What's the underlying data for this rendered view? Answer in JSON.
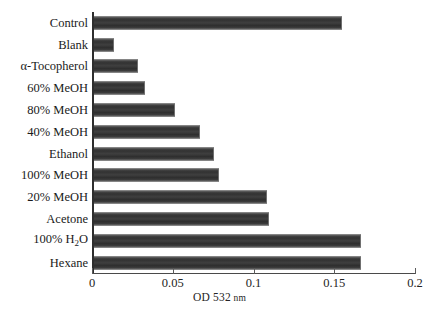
{
  "chart_data": {
    "type": "bar",
    "orientation": "horizontal",
    "title": "",
    "xlabel": "OD 532 nm",
    "ylabel": "",
    "xlim": [
      0,
      0.2
    ],
    "xticks": [
      "0",
      "0.05",
      "0.1",
      "0.15",
      "0.2"
    ],
    "xtick_values": [
      0,
      0.05,
      0.1,
      0.15,
      0.2
    ],
    "grid": false,
    "legend": null,
    "bar_color": "#3a3a3a",
    "categories": [
      "Control",
      "Blank",
      "α-Tocopherol",
      "60% MeOH",
      "80% MeOH",
      "40% MeOH",
      "Ethanol",
      "100% MeOH",
      "20% MeOH",
      "Acetone",
      "100% H2O",
      "Hexane"
    ],
    "categories_html": [
      "Control",
      "Blank",
      "α-Tocopherol",
      "60% MeOH",
      "80% MeOH",
      "40% MeOH",
      "Ethanol",
      "100% MeOH",
      "20% MeOH",
      "Acetone",
      "100% H<sub>2</sub>O",
      "Hexane"
    ],
    "values": [
      0.154,
      0.013,
      0.028,
      0.032,
      0.051,
      0.066,
      0.075,
      0.078,
      0.108,
      0.109,
      0.166,
      0.166
    ],
    "axis_title_main": "OD 532",
    "axis_title_unit": "nm"
  }
}
